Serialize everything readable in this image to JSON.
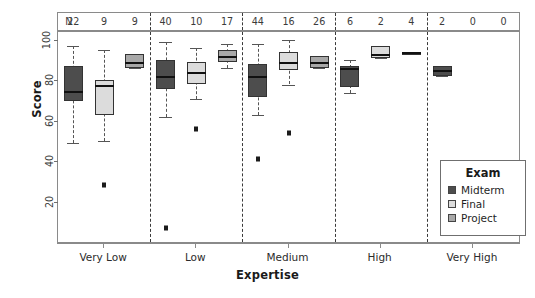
{
  "chart_data": {
    "type": "box",
    "title": "",
    "xlabel": "Expertise",
    "ylabel": "Score",
    "ylim": [
      0,
      104
    ],
    "yticks": [
      20,
      40,
      60,
      80,
      100
    ],
    "categories": [
      "Very Low",
      "Low",
      "Medium",
      "High",
      "Very High"
    ],
    "legend": {
      "title": "Exam",
      "position": "bottom-right",
      "entries": [
        {
          "name": "Midterm",
          "color": "#4d4d4d"
        },
        {
          "name": "Final",
          "color": "#dcdcdc"
        },
        {
          "name": "Project",
          "color": "#a8a8a8"
        }
      ]
    },
    "counts_row": {
      "label": "N",
      "values": [
        22,
        9,
        9,
        40,
        10,
        17,
        44,
        16,
        26,
        6,
        2,
        4,
        2,
        0,
        0
      ]
    },
    "boxes": [
      {
        "group": "Very Low",
        "series": "Midterm",
        "n": 22,
        "min": 49,
        "q1": 70,
        "median": 75,
        "q3": 87,
        "max": 97,
        "outliers": []
      },
      {
        "group": "Very Low",
        "series": "Final",
        "n": 9,
        "min": 50,
        "q1": 63,
        "median": 78,
        "q3": 80,
        "max": 95,
        "outliers": [
          28
        ]
      },
      {
        "group": "Very Low",
        "series": "Project",
        "n": 9,
        "min": 86,
        "q1": 86,
        "median": 89,
        "q3": 93,
        "max": 93,
        "outliers": []
      },
      {
        "group": "Low",
        "series": "Midterm",
        "n": 40,
        "min": 62,
        "q1": 76,
        "median": 82,
        "q3": 90,
        "max": 99,
        "outliers": [
          7
        ]
      },
      {
        "group": "Low",
        "series": "Final",
        "n": 10,
        "min": 71,
        "q1": 78,
        "median": 84,
        "q3": 89,
        "max": 96,
        "outliers": [
          56
        ]
      },
      {
        "group": "Low",
        "series": "Project",
        "n": 17,
        "min": 86,
        "q1": 89,
        "median": 92,
        "q3": 95,
        "max": 98,
        "outliers": []
      },
      {
        "group": "Medium",
        "series": "Midterm",
        "n": 44,
        "min": 63,
        "q1": 72,
        "median": 82,
        "q3": 88,
        "max": 98,
        "outliers": [
          41
        ]
      },
      {
        "group": "Medium",
        "series": "Final",
        "n": 16,
        "min": 78,
        "q1": 85,
        "median": 89,
        "q3": 94,
        "max": 100,
        "outliers": [
          54
        ]
      },
      {
        "group": "Medium",
        "series": "Project",
        "n": 26,
        "min": 86,
        "q1": 86,
        "median": 89,
        "q3": 92,
        "max": 92,
        "outliers": []
      },
      {
        "group": "High",
        "series": "Midterm",
        "n": 6,
        "min": 74,
        "q1": 77,
        "median": 86,
        "q3": 87,
        "max": 90,
        "outliers": []
      },
      {
        "group": "High",
        "series": "Final",
        "n": 2,
        "min": 91,
        "q1": 91,
        "median": 93,
        "q3": 97,
        "max": 97,
        "outliers": []
      },
      {
        "group": "High",
        "series": "Project",
        "n": 4,
        "min": 94,
        "q1": 94,
        "median": 94,
        "q3": 94,
        "max": 94,
        "outliers": []
      },
      {
        "group": "Very High",
        "series": "Midterm",
        "n": 2,
        "min": 82,
        "q1": 82,
        "median": 85,
        "q3": 87,
        "max": 87,
        "outliers": []
      }
    ]
  }
}
